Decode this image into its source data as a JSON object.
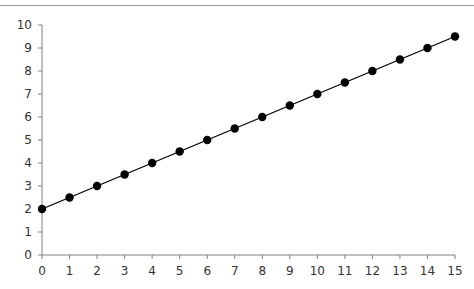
{
  "chart_data": {
    "type": "line",
    "title": "",
    "xlabel": "",
    "ylabel": "",
    "x": [
      0,
      1,
      2,
      3,
      4,
      5,
      6,
      7,
      8,
      9,
      10,
      11,
      12,
      13,
      14,
      15
    ],
    "series": [
      {
        "name": "series-1",
        "values": [
          2,
          2.5,
          3,
          3.5,
          4,
          4.5,
          5,
          5.5,
          6,
          6.5,
          7,
          7.5,
          8,
          8.5,
          9,
          9.5
        ]
      }
    ],
    "xlim": [
      0,
      15
    ],
    "ylim": [
      0,
      10
    ],
    "x_ticks": [
      "0",
      "1",
      "2",
      "3",
      "4",
      "5",
      "6",
      "7",
      "8",
      "9",
      "10",
      "11",
      "12",
      "13",
      "14",
      "15"
    ],
    "y_ticks": [
      "0",
      "1",
      "2",
      "3",
      "4",
      "5",
      "6",
      "7",
      "8",
      "9",
      "10"
    ],
    "grid": false,
    "legend": "none",
    "colors": {
      "line": "#000000",
      "marker": "#000000",
      "axis": "#808080",
      "text": "#333333"
    }
  }
}
